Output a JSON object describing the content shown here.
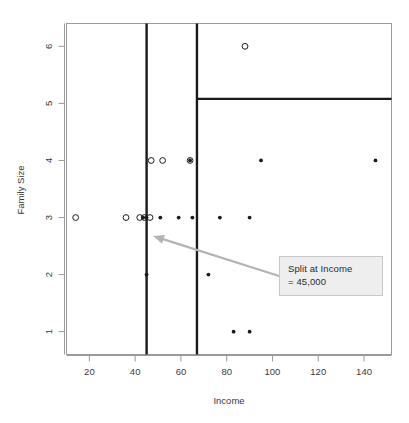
{
  "figure": {
    "background_color": "#ffffff",
    "frame_color": "#808080",
    "split_line_color": "#1a1a1a",
    "point_color": "#1a1a1a",
    "arrow_color": "#b4b4b4"
  },
  "annotation": {
    "name": "split-callout",
    "line1": "Split at Income",
    "line2": "= 45,000",
    "background": "#eeeeee",
    "border": "#c8c8c8",
    "arrow_from": [
      279,
      276
    ],
    "arrow_to": [
      153,
      236
    ]
  },
  "chart_data": {
    "type": "scatter",
    "title": "",
    "xlabel": "Income",
    "ylabel": "Family Size",
    "xlim": [
      10,
      152
    ],
    "ylim": [
      0.6,
      6.4
    ],
    "grid": false,
    "legend": null,
    "xticks": [
      20,
      40,
      60,
      80,
      100,
      120,
      140
    ],
    "xticklabels": [
      "20",
      "40",
      "60",
      "80",
      "100",
      "120",
      "140"
    ],
    "yticks": [
      1,
      2,
      3,
      4,
      5,
      6
    ],
    "yticklabels": [
      "1",
      "2",
      "3",
      "4",
      "5",
      "6"
    ],
    "series": [
      {
        "name": "hollow",
        "marker": "open-circle",
        "points": [
          {
            "x": 14,
            "y": 3
          },
          {
            "x": 36,
            "y": 3
          },
          {
            "x": 42,
            "y": 3
          },
          {
            "x": 44,
            "y": 3
          },
          {
            "x": 46.5,
            "y": 3
          },
          {
            "x": 47,
            "y": 4
          },
          {
            "x": 52,
            "y": 4
          },
          {
            "x": 64,
            "y": 4
          },
          {
            "x": 88,
            "y": 6
          }
        ]
      },
      {
        "name": "filled",
        "marker": "filled-circle",
        "points": [
          {
            "x": 43.5,
            "y": 3
          },
          {
            "x": 45,
            "y": 3
          },
          {
            "x": 51,
            "y": 3
          },
          {
            "x": 59,
            "y": 3
          },
          {
            "x": 65,
            "y": 3
          },
          {
            "x": 77,
            "y": 3
          },
          {
            "x": 90,
            "y": 3
          },
          {
            "x": 64,
            "y": 4
          },
          {
            "x": 95,
            "y": 4
          },
          {
            "x": 145,
            "y": 4
          },
          {
            "x": 45,
            "y": 2
          },
          {
            "x": 72,
            "y": 2
          },
          {
            "x": 83,
            "y": 1
          },
          {
            "x": 90,
            "y": 1
          }
        ]
      }
    ],
    "partition_lines": [
      {
        "name": "split-income-45",
        "orientation": "vertical",
        "value": 45,
        "from": 0.6,
        "to": 6.4
      },
      {
        "name": "split-income-67",
        "orientation": "vertical",
        "value": 67,
        "from": 0.6,
        "to": 6.4
      },
      {
        "name": "split-family-size-5",
        "orientation": "horizontal",
        "value": 5.08,
        "from": 67,
        "to": 152
      }
    ]
  }
}
